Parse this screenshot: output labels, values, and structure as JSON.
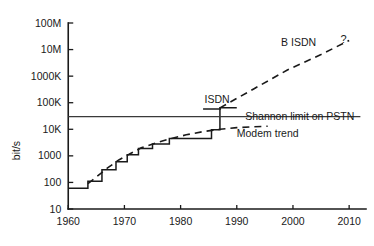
{
  "chart_data": {
    "type": "line",
    "title": "",
    "subtitle": "",
    "xlabel": "",
    "ylabel": "bit/s",
    "xlim": [
      1958,
      2013
    ],
    "ylim": [
      10,
      100000000
    ],
    "yscale": "log",
    "grid": false,
    "legend_position": "inline-annotations",
    "x_ticks": [
      1960,
      1970,
      1980,
      1990,
      2000,
      2010
    ],
    "x_tick_labels": [
      "1960",
      "1970",
      "1980",
      "1990",
      "2000",
      "2010"
    ],
    "y_ticks": [
      10,
      100,
      1000,
      10000,
      100000,
      1000000,
      10000000,
      100000000
    ],
    "y_tick_labels": [
      "10",
      "100",
      "1000",
      "10K",
      "100K",
      "1000K",
      "10M",
      "100M"
    ],
    "series": [
      {
        "name": "ISDN staircase",
        "style": "solid-step",
        "points": [
          [
            1960,
            60
          ],
          [
            1963.5,
            60
          ],
          [
            1963.5,
            110
          ],
          [
            1966,
            110
          ],
          [
            1966,
            300
          ],
          [
            1968.5,
            300
          ],
          [
            1968.5,
            600
          ],
          [
            1970.5,
            600
          ],
          [
            1970.5,
            1100
          ],
          [
            1972.5,
            1100
          ],
          [
            1972.5,
            1900
          ],
          [
            1975,
            1900
          ],
          [
            1975,
            2800
          ],
          [
            1978,
            2800
          ],
          [
            1978,
            4500
          ],
          [
            1985.5,
            4500
          ],
          [
            1985.5,
            9600
          ],
          [
            1987,
            9600
          ],
          [
            1987,
            64000
          ],
          [
            1990,
            64000
          ]
        ]
      },
      {
        "name": "Modem trend",
        "style": "dashed",
        "points": [
          [
            1963.5,
            90
          ],
          [
            1965,
            160
          ],
          [
            1967,
            350
          ],
          [
            1969,
            700
          ],
          [
            1971,
            1200
          ],
          [
            1973,
            2000
          ],
          [
            1975.5,
            3000
          ],
          [
            1978,
            4300
          ],
          [
            1981,
            6200
          ],
          [
            1984,
            8200
          ],
          [
            1987,
            10000
          ],
          [
            1990,
            11500
          ],
          [
            1993,
            12500
          ],
          [
            1995.5,
            13000
          ]
        ]
      },
      {
        "name": "B ISDN",
        "style": "dashed",
        "points": [
          [
            1987,
            64000
          ],
          [
            1993,
            330000
          ],
          [
            1999,
            1700000
          ],
          [
            2005,
            6500000
          ],
          [
            2010,
            22000000
          ]
        ]
      },
      {
        "name": "Shannon limit on PSTN",
        "style": "solid-horizontal",
        "value": 30000,
        "x_from": 1960,
        "x_to": 2012
      }
    ],
    "annotations": [
      {
        "name": "isdn",
        "text": "ISDN",
        "x": 1986.5,
        "y": 95000
      },
      {
        "name": "b-isdn",
        "text": "B ISDN",
        "x": 2001,
        "y": 14000000
      },
      {
        "name": "b-isdn-question",
        "text": "?",
        "x": 2009,
        "y": 18000000
      },
      {
        "name": "shannon-limit",
        "text": "Shannon limit on PSTN",
        "x": 1991.5,
        "y": 22000
      },
      {
        "name": "modem-trend",
        "text": "Modem trend",
        "x": 1990,
        "y": 5200
      }
    ]
  }
}
